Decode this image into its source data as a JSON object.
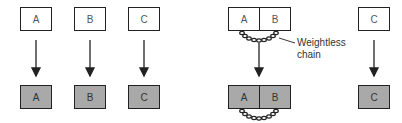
{
  "left_scenario": {
    "before": [
      {
        "label": "A"
      },
      {
        "label": "B"
      },
      {
        "label": "C"
      }
    ],
    "after": [
      {
        "label": "A"
      },
      {
        "label": "B"
      },
      {
        "label": "C"
      }
    ]
  },
  "right_scenario": {
    "before": {
      "joined": [
        "A",
        "B"
      ],
      "single": "C"
    },
    "after": {
      "joined": [
        "A",
        "B"
      ],
      "single": "C"
    },
    "annotation": {
      "line1": "Weightless",
      "line2": "chain"
    }
  },
  "colors": {
    "before_fill": "#ffffff",
    "after_fill": "#a9a9a9",
    "stroke": "#222222"
  }
}
